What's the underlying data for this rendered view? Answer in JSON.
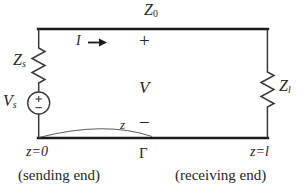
{
  "figure": {
    "kind": "transmission-line-circuit-diagram",
    "background_color": "#ffffff",
    "line_color": "#1a1a1a"
  },
  "labels": {
    "characteristic_impedance": "Z",
    "characteristic_impedance_sub": "0",
    "source_impedance": "Z",
    "source_impedance_sub": "s",
    "source_voltage": "V",
    "source_voltage_sub": "s",
    "load_impedance": "Z",
    "load_impedance_sub": "l",
    "current": "I",
    "current_arrow": "→",
    "terminal_plus": "+",
    "line_voltage": "V",
    "terminal_minus": "−",
    "distance_variable": "z",
    "reflection_coefficient": "Γ",
    "sending_position": "z=0",
    "receiving_position": "z=l",
    "sending_end_caption": "(sending end)",
    "receiving_end_caption": "(receiving end)",
    "source_symbol_plus": "+",
    "source_symbol_minus": "−"
  }
}
